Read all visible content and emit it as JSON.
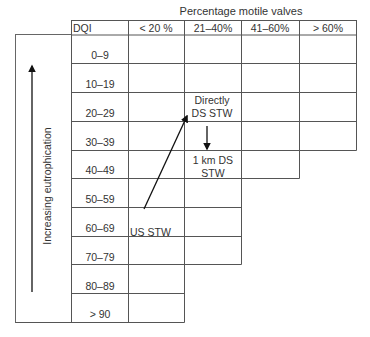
{
  "title": "Percentage motile valves",
  "header": {
    "row_label": "DQI",
    "columns": [
      "< 20 %",
      "21–40%",
      "41–60%",
      "> 60%"
    ]
  },
  "rows": [
    {
      "label": "0–9",
      "max_col": 4
    },
    {
      "label": "10–19",
      "max_col": 4
    },
    {
      "label": "20–29",
      "max_col": 4
    },
    {
      "label": "30–39",
      "max_col": 4
    },
    {
      "label": "40–49",
      "max_col": 3
    },
    {
      "label": "50–59",
      "max_col": 2
    },
    {
      "label": "60–69",
      "max_col": 2
    },
    {
      "label": "70–79",
      "max_col": 2
    },
    {
      "label": "80–89",
      "max_col": 1
    },
    {
      "label": "> 90",
      "max_col": 1
    }
  ],
  "axis": {
    "label": "Increasing eutrophication",
    "direction": "up",
    "icon": "arrow-up-icon"
  },
  "annotations": {
    "us_stw": "US STW",
    "directly_ds_line1": "Directly",
    "directly_ds_line2": "DS STW",
    "km_ds_line1": "1 km DS",
    "km_ds_line2": "STW"
  },
  "transitions": [
    {
      "from": "US STW",
      "to": "Directly DS STW",
      "icon": "arrow-diagonal-icon"
    },
    {
      "from": "Directly DS STW",
      "to": "1 km DS STW",
      "icon": "arrow-down-icon"
    }
  ],
  "colors": {
    "line": "#555555",
    "arrow": "#111111",
    "text": "#333333"
  }
}
